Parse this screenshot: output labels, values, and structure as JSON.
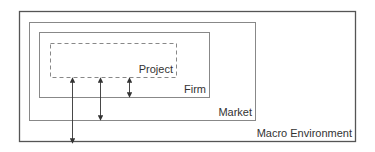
{
  "diagram": {
    "type": "nested-boxes",
    "boxes": [
      {
        "id": "macro",
        "label": "Macro Environment",
        "style": "solid"
      },
      {
        "id": "market",
        "label": "Market",
        "style": "solid"
      },
      {
        "id": "firm",
        "label": "Firm",
        "style": "solid"
      },
      {
        "id": "project",
        "label": "Project",
        "style": "dashed"
      }
    ],
    "arrows": [
      {
        "from": "project",
        "to": "macro",
        "direction": "bidirectional"
      },
      {
        "from": "project",
        "to": "market",
        "direction": "bidirectional"
      },
      {
        "from": "project",
        "to": "firm",
        "direction": "bidirectional"
      }
    ],
    "colors": {
      "stroke_outer": "#555555",
      "stroke_inner": "#999999",
      "text": "#333333"
    }
  }
}
